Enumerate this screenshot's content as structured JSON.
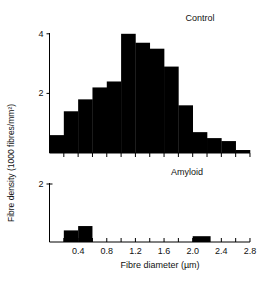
{
  "chart_data": [
    {
      "type": "bar",
      "title": "Control",
      "xlabel": "Fibre diameter (µm)",
      "ylabel": "Fibre density (1000 fibres/mm²)",
      "bin_edges": [
        0.0,
        0.2,
        0.4,
        0.6,
        0.8,
        1.0,
        1.2,
        1.4,
        1.6,
        1.8,
        2.0,
        2.2,
        2.4,
        2.6,
        2.8
      ],
      "categories": [
        "0.0-0.2",
        "0.2-0.4",
        "0.4-0.6",
        "0.6-0.8",
        "0.8-1.0",
        "1.0-1.2",
        "1.2-1.4",
        "1.4-1.6",
        "1.6-1.8",
        "1.8-2.0",
        "2.0-2.2",
        "2.2-2.4",
        "2.4-2.6",
        "2.6-2.8"
      ],
      "values": [
        0.6,
        1.4,
        1.8,
        2.2,
        2.4,
        4.0,
        3.7,
        3.5,
        2.9,
        1.6,
        0.7,
        0.5,
        0.4,
        0.1
      ],
      "yticks": [
        2,
        4
      ],
      "ylim": [
        0,
        4
      ],
      "xlim": [
        0,
        2.8
      ],
      "grid": false
    },
    {
      "type": "bar",
      "title": "Amyloid",
      "xlabel": "Fibre diameter (µm)",
      "ylabel": "Fibre density (1000 fibres/mm²)",
      "bars": [
        {
          "from": 0.2,
          "to": 0.4,
          "value": 0.4
        },
        {
          "from": 0.4,
          "to": 0.6,
          "value": 0.55
        },
        {
          "from": 2.0,
          "to": 2.25,
          "value": 0.2
        }
      ],
      "yticks": [
        2
      ],
      "ylim": [
        0,
        2
      ],
      "xticks": [
        "0.4",
        "0.8",
        "1.2",
        "1.6",
        "2.0",
        "2.4",
        "2.8"
      ],
      "xlim": [
        0,
        2.8
      ],
      "grid": false
    }
  ],
  "labels": {
    "control_title": "Control",
    "amyloid_title": "Amyloid",
    "ylabel": "Fibre density (1000 fibres/mm²)",
    "xlabel": "Fibre diameter (µm)",
    "control_ytick_4": "4",
    "control_ytick_2": "2",
    "amyloid_ytick_2": "2"
  }
}
